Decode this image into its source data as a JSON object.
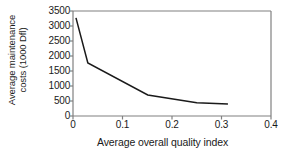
{
  "chart_data": {
    "type": "line",
    "title": "",
    "xlabel": "Average overall quality index",
    "ylabel": "Average maintenance costs (1000 Dfl)",
    "ylabel_line1": "Average maintenance",
    "ylabel_line2": "costs (1000 Dfl)",
    "xlim": [
      0,
      0.4
    ],
    "ylim": [
      0,
      3500
    ],
    "xticks": [
      0,
      0.1,
      0.2,
      0.3,
      0.4
    ],
    "xtick_labels": [
      "0",
      "0.1",
      "0.2",
      "0.3",
      "0.4"
    ],
    "yticks": [
      0,
      500,
      1000,
      1500,
      2000,
      2500,
      3000,
      3500
    ],
    "ytick_labels": [
      "0",
      "500",
      "1000",
      "1500",
      "2000",
      "2500",
      "3000",
      "3500"
    ],
    "grid": false,
    "legend": null,
    "line_color": "#1a1a1a",
    "frame_color": "#808080",
    "series": [
      {
        "name": "Average maintenance costs",
        "x": [
          0.006,
          0.03,
          0.151,
          0.25,
          0.313
        ],
        "values": [
          3270,
          1770,
          700,
          440,
          400
        ]
      }
    ]
  }
}
